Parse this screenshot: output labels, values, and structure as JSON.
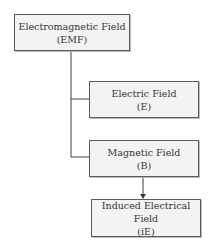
{
  "diagram": {
    "type": "hierarchy",
    "nodes": [
      {
        "id": "emf",
        "title": "Electromagnetic Field",
        "abbr": "(EMF)"
      },
      {
        "id": "e",
        "title": "Electric Field",
        "abbr": "(E)"
      },
      {
        "id": "b",
        "title": "Magnetic Field",
        "abbr": "(B)"
      },
      {
        "id": "ie",
        "title": "Induced Electrical Field",
        "abbr": "(iE)"
      }
    ],
    "edges": [
      {
        "from": "emf",
        "to": "e",
        "style": "line"
      },
      {
        "from": "emf",
        "to": "b",
        "style": "line"
      },
      {
        "from": "b",
        "to": "ie",
        "style": "arrow"
      }
    ]
  }
}
